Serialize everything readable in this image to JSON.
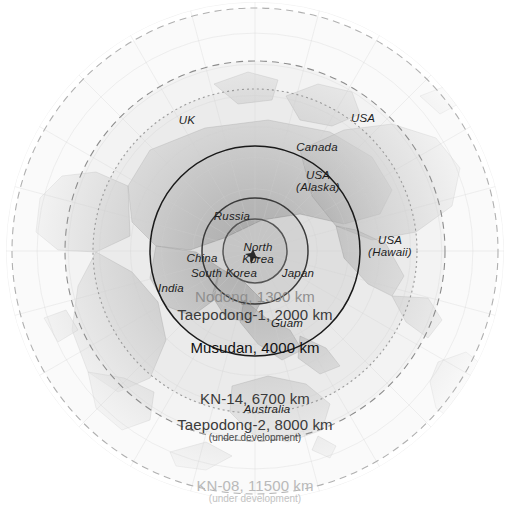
{
  "figure": {
    "kind": "azimuthal-equidistant-range-ring-map",
    "center_place": "North Korea",
    "background_color": "#ffffff"
  },
  "chart_data": {
    "type": "map",
    "title": "",
    "projection": "azimuthal equidistant centred on North Korea",
    "center": {
      "label": "North Korea",
      "x": 255,
      "y": 251
    },
    "rings": [
      {
        "name": "Nodong",
        "label": "Nodong, 1300 km",
        "range_km": 1300,
        "radius_px": 32,
        "style": "solid",
        "stroke": "#555555",
        "fill": "#b9b9b9",
        "status": ""
      },
      {
        "name": "Taepodong-1",
        "label": "Taepodong-1, 2000 km",
        "range_km": 2000,
        "radius_px": 53,
        "style": "solid",
        "stroke": "#3a3a3a",
        "fill": "#c8c8c8",
        "status": ""
      },
      {
        "name": "Musudan",
        "label": "Musudan, 4000 km",
        "range_km": 4000,
        "radius_px": 105,
        "style": "solid",
        "stroke": "#1a1a1a",
        "fill": "#d6d6d6",
        "status": ""
      },
      {
        "name": "KN-14",
        "label": "KN-14, 6700 km",
        "range_km": 6700,
        "radius_px": 162,
        "style": "dotted",
        "stroke": "#9a9a9a",
        "fill": "#e4e4e4",
        "status": ""
      },
      {
        "name": "Taepodong-2",
        "label": "Taepodong-2, 8000 km",
        "range_km": 8000,
        "radius_px": 190,
        "style": "dashed",
        "stroke": "#8d8d8d",
        "fill": "#ececec",
        "status": "under development"
      },
      {
        "name": "KN-08",
        "label": "KN-08, 11500 km",
        "range_km": 11500,
        "radius_px": 243,
        "style": "dashed",
        "stroke": "#b0b0b0",
        "fill": "#f6f6f6",
        "status": "under development"
      }
    ],
    "range_labels": [
      {
        "id": "nodong",
        "main": "Nodong, 1300 km",
        "sub": "",
        "x": 255,
        "y": 296,
        "emphasis": "faint"
      },
      {
        "id": "taepodong1",
        "main": "Taepodong-1, 2000 km",
        "sub": "",
        "x": 255,
        "y": 314,
        "emphasis": "mid"
      },
      {
        "id": "musudan",
        "main": "Musudan, 4000 km",
        "sub": "",
        "x": 255,
        "y": 347,
        "emphasis": "strong"
      },
      {
        "id": "kn14",
        "main": "KN-14, 6700 km",
        "sub": "",
        "x": 255,
        "y": 398,
        "emphasis": "mid"
      },
      {
        "id": "taepodong2",
        "main": "Taepodong-2, 8000 km",
        "sub": "(under development)",
        "x": 255,
        "y": 429,
        "emphasis": "mid"
      },
      {
        "id": "kn08",
        "main": "KN-08, 11500 km",
        "sub": "(under development)",
        "x": 255,
        "y": 490,
        "emphasis": "vfaint"
      }
    ],
    "country_labels": [
      {
        "id": "uk",
        "text": "UK",
        "x": 187,
        "y": 120,
        "lines": [
          "UK"
        ]
      },
      {
        "id": "usa",
        "text": "USA",
        "x": 363,
        "y": 118,
        "lines": [
          "USA"
        ]
      },
      {
        "id": "canada",
        "text": "Canada",
        "x": 317,
        "y": 147,
        "lines": [
          "Canada"
        ]
      },
      {
        "id": "usa-alaska",
        "text": "USA (Alaska)",
        "x": 318,
        "y": 181,
        "lines": [
          "USA",
          "(Alaska)"
        ]
      },
      {
        "id": "usa-hawaii",
        "text": "USA (Hawaii)",
        "x": 390,
        "y": 246,
        "lines": [
          "USA",
          "(Hawaii)"
        ]
      },
      {
        "id": "russia",
        "text": "Russia",
        "x": 232,
        "y": 216,
        "lines": [
          "Russia"
        ]
      },
      {
        "id": "north-korea",
        "text": "North Korea",
        "x": 258,
        "y": 253,
        "lines": [
          "North",
          "Korea"
        ]
      },
      {
        "id": "china",
        "text": "China",
        "x": 202,
        "y": 258,
        "lines": [
          "China"
        ]
      },
      {
        "id": "south-korea",
        "text": "South Korea",
        "x": 224,
        "y": 273,
        "lines": [
          "South Korea"
        ]
      },
      {
        "id": "japan",
        "text": "Japan",
        "x": 298,
        "y": 273,
        "lines": [
          "Japan"
        ]
      },
      {
        "id": "india",
        "text": "India",
        "x": 171,
        "y": 288,
        "lines": [
          "India"
        ]
      },
      {
        "id": "guam",
        "text": "Guam",
        "x": 287,
        "y": 323,
        "lines": [
          "Guam"
        ]
      },
      {
        "id": "australia",
        "text": "Australia",
        "x": 267,
        "y": 409,
        "lines": [
          "Australia"
        ]
      }
    ],
    "graticule": {
      "meridian_count": 24,
      "parallel_count": 8,
      "color": "#c9c9c9"
    }
  }
}
